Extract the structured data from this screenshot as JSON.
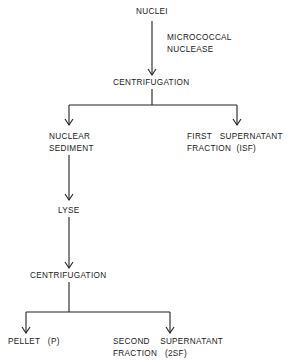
{
  "diagram": {
    "type": "flowchart",
    "nodes": {
      "nuclei": "NUCLEI",
      "nuclease_line1": "MICROCOCCAL",
      "nuclease_line2": "NUCLEASE",
      "centrifugation_1": "CENTRIFUGATION",
      "nuclear_sediment_line1": "NUCLEAR",
      "nuclear_sediment_line2": "SEDIMENT",
      "isf_line1": "FIRST   SUPERNATANT",
      "isf_line2": "FRACTION  (ISF)",
      "lyse": "LYSE",
      "centrifugation_2": "CENTRIFUGATION",
      "pellet": "PELLET   (P)",
      "sf2_line1": "SECOND    SUPERNATANT",
      "sf2_line2": "FRACTION   (2SF)"
    },
    "edges": [
      {
        "from": "NUCLEI",
        "to": "CENTRIFUGATION",
        "label": "MICROCOCCAL NUCLEASE"
      },
      {
        "from": "CENTRIFUGATION",
        "to": "NUCLEAR SEDIMENT"
      },
      {
        "from": "CENTRIFUGATION",
        "to": "FIRST SUPERNATANT FRACTION (ISF)"
      },
      {
        "from": "NUCLEAR SEDIMENT",
        "to": "LYSE"
      },
      {
        "from": "LYSE",
        "to": "CENTRIFUGATION (2)"
      },
      {
        "from": "CENTRIFUGATION (2)",
        "to": "PELLET (P)"
      },
      {
        "from": "CENTRIFUGATION (2)",
        "to": "SECOND SUPERNATANT FRACTION (2SF)"
      }
    ]
  }
}
